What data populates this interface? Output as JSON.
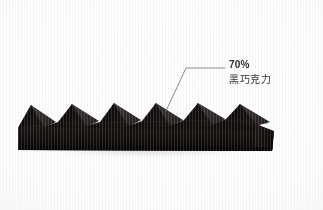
{
  "scene": {
    "width": 323,
    "height": 210,
    "background_color": "#fcfcfc",
    "subject": "dark-chocolate-bar"
  },
  "annotation": {
    "percent_label": "70%",
    "product_label": "黑巧克力",
    "line_color": "#6b6b70",
    "text_color": "#2c2c2f",
    "leader": {
      "anchor_x": 166,
      "anchor_y": 111,
      "elbow_x": 186,
      "elbow_y": 68,
      "end_x": 225,
      "end_y": 68
    }
  },
  "chocolate": {
    "body_color": "#14100f",
    "facet_light": "#2b2320",
    "facet_mid": "#1d1716",
    "facet_dark": "#0b0908",
    "base_color": "#120e0d",
    "peak_count": 5,
    "left_x": 18,
    "right_x": 274,
    "top_y": 103,
    "base_y": 150
  },
  "shadow": {
    "color": "#8c8c91",
    "opacity": 0.42
  }
}
